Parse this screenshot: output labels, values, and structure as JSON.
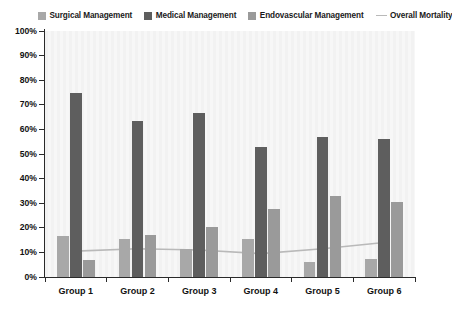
{
  "legend": {
    "entries": [
      {
        "label": "Surgical Management",
        "marker": "swatch",
        "color": "#a8a8a8",
        "name": "legend-surgical-management"
      },
      {
        "label": "Medical Management",
        "marker": "swatch",
        "color": "#5e5e5e",
        "name": "legend-medical-management"
      },
      {
        "label": "Endovascular Management",
        "marker": "swatch",
        "color": "#9a9a9a",
        "name": "legend-endovascular-management"
      },
      {
        "label": "Overall Mortality",
        "marker": "line",
        "color": "#b9b9b9",
        "name": "legend-overall-mortality"
      }
    ]
  },
  "axes": {
    "y_tick_labels": [
      "100%",
      "90%",
      "80%",
      "70%",
      "60%",
      "50%",
      "40%",
      "30%",
      "20%",
      "10%",
      "0%"
    ],
    "x_tick_labels": [
      "Group 1",
      "Group 2",
      "Group 3",
      "Group 4",
      "Group 5",
      "Group 6"
    ]
  },
  "chart_data": {
    "type": "bar",
    "title": "",
    "subtitle": "",
    "xlabel": "",
    "ylabel": "",
    "ylim": [
      0,
      100
    ],
    "y_unit": "%",
    "y_tick_step": 10,
    "grid": false,
    "legend_position": "top",
    "categories": [
      "Group 1",
      "Group 2",
      "Group 3",
      "Group 4",
      "Group 5",
      "Group 6"
    ],
    "series": [
      {
        "name": "Surgical Management",
        "type": "bar",
        "color": "#a8a8a8",
        "values": [
          16.5,
          15.5,
          11.5,
          15.5,
          6.0,
          7.5
        ]
      },
      {
        "name": "Medical Management",
        "type": "bar",
        "color": "#5e5e5e",
        "values": [
          75.0,
          63.5,
          66.5,
          53.0,
          57.0,
          56.0
        ]
      },
      {
        "name": "Endovascular Management",
        "type": "bar",
        "color": "#9a9a9a",
        "values": [
          7.0,
          17.0,
          20.5,
          27.5,
          33.0,
          30.5
        ]
      },
      {
        "name": "Overall Mortality",
        "type": "line",
        "color": "#b9b9b9",
        "values": [
          10.5,
          11.5,
          11.0,
          9.5,
          11.5,
          14.0
        ]
      }
    ]
  }
}
